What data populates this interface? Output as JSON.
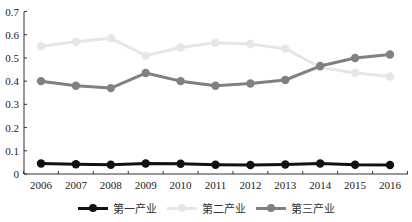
{
  "chart_data": {
    "type": "line",
    "title": "",
    "xlabel": "",
    "ylabel": "",
    "x": [
      "2006",
      "2007",
      "2008",
      "2009",
      "2010",
      "2011",
      "2012",
      "2013",
      "2014",
      "2015",
      "2016"
    ],
    "ylim": [
      0,
      0.7
    ],
    "yticks": [
      "0",
      "0.1",
      "0.2",
      "0.3",
      "0.4",
      "0.5",
      "0.6",
      "0.7"
    ],
    "grid": false,
    "legend_position": "bottom",
    "series": [
      {
        "name": "第一产业",
        "color": "#111111",
        "values": [
          0.045,
          0.042,
          0.04,
          0.045,
          0.044,
          0.04,
          0.039,
          0.041,
          0.045,
          0.04,
          0.039
        ]
      },
      {
        "name": "第二产业",
        "color": "#e6e6e6",
        "values": [
          0.55,
          0.57,
          0.585,
          0.51,
          0.545,
          0.565,
          0.56,
          0.54,
          0.46,
          0.435,
          0.42
        ]
      },
      {
        "name": "第三产业",
        "color": "#808080",
        "values": [
          0.4,
          0.38,
          0.37,
          0.435,
          0.4,
          0.38,
          0.39,
          0.405,
          0.465,
          0.5,
          0.515
        ]
      }
    ]
  },
  "legend": {
    "items": [
      {
        "label": "第一产业"
      },
      {
        "label": "第二产业"
      },
      {
        "label": "第三产业"
      }
    ]
  }
}
